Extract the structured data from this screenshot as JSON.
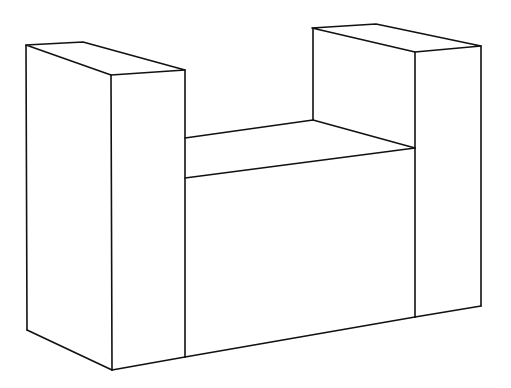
{
  "figure": {
    "stroke_color": "#111111",
    "background": "#ffffff"
  },
  "shapes": {
    "left_pillar": {
      "top_face": [
        [
          26,
          45
        ],
        [
          83,
          42
        ],
        [
          185,
          70
        ],
        [
          111,
          75
        ]
      ],
      "edges": [
        [
          [
            26,
            45
          ],
          [
            27,
            330
          ]
        ],
        [
          [
            111,
            75
          ],
          [
            112,
            370
          ]
        ],
        [
          [
            185,
            70
          ],
          [
            185,
            357
          ]
        ],
        [
          [
            27,
            330
          ],
          [
            112,
            370
          ]
        ],
        [
          [
            112,
            370
          ],
          [
            185,
            357
          ]
        ]
      ]
    },
    "middle_block": {
      "top_face": [
        [
          185,
          138
        ],
        [
          313,
          120
        ],
        [
          415,
          148
        ],
        [
          185,
          178
        ]
      ],
      "edges": [
        [
          [
            185,
            178
          ],
          [
            415,
            148
          ]
        ],
        [
          [
            185,
            357
          ],
          [
            415,
            317
          ]
        ]
      ]
    },
    "right_pillar": {
      "top_face": [
        [
          312,
          28
        ],
        [
          376,
          24
        ],
        [
          481,
          46
        ],
        [
          415,
          52
        ]
      ],
      "edges": [
        [
          [
            313,
            28
          ],
          [
            313,
            120
          ]
        ],
        [
          [
            415,
            52
          ],
          [
            415,
            317
          ]
        ],
        [
          [
            481,
            46
          ],
          [
            481,
            306
          ]
        ],
        [
          [
            415,
            317
          ],
          [
            481,
            306
          ]
        ],
        [
          [
            313,
            120
          ],
          [
            415,
            148
          ]
        ]
      ]
    }
  }
}
